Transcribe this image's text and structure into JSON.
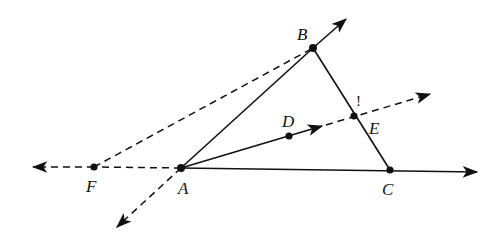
{
  "diagram": {
    "type": "geometry-construction",
    "points": [
      {
        "id": "A",
        "label": "A",
        "x": 181,
        "y": 168
      },
      {
        "id": "B",
        "label": "B",
        "x": 313,
        "y": 48
      },
      {
        "id": "C",
        "label": "C",
        "x": 390,
        "y": 170
      },
      {
        "id": "D",
        "label": "D",
        "x": 289,
        "y": 136
      },
      {
        "id": "E",
        "label": "E",
        "x": 354,
        "y": 116
      },
      {
        "id": "F",
        "label": "F",
        "x": 94,
        "y": 167
      }
    ],
    "segments": [
      {
        "from": "A",
        "to": "B",
        "style": "solid",
        "note": "ray AB extended past B with arrow"
      },
      {
        "from": "B",
        "to": "C",
        "style": "solid"
      },
      {
        "from": "A",
        "to": "C",
        "style": "solid",
        "note": "ray AC extended past C with arrow"
      },
      {
        "from": "A",
        "to": "D",
        "style": "solid",
        "note": "ray AD with arrow beyond D"
      },
      {
        "from": "D",
        "to": "E",
        "style": "dashed",
        "note": "continuation of ray AD through E with arrow"
      },
      {
        "from": "F",
        "to": "B",
        "style": "dashed"
      },
      {
        "from": "F",
        "to": "A",
        "style": "dashed",
        "note": "line extended left past F with arrow"
      },
      {
        "from": "A",
        "to": "down-left",
        "style": "dashed",
        "note": "ray BA extended past A with arrow"
      }
    ],
    "annotations": [
      {
        "text": "!",
        "near": "E"
      }
    ],
    "labels": {
      "A": "A",
      "B": "B",
      "C": "C",
      "D": "D",
      "E": "E",
      "F": "F",
      "mark": "!"
    }
  }
}
